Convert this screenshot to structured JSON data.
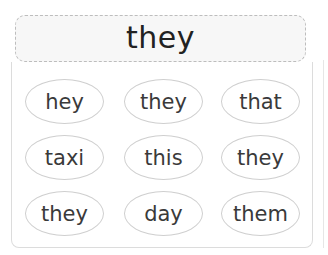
{
  "target": {
    "word": "they"
  },
  "options": [
    {
      "label": "hey"
    },
    {
      "label": "they"
    },
    {
      "label": "that"
    },
    {
      "label": "taxi"
    },
    {
      "label": "this"
    },
    {
      "label": "they"
    },
    {
      "label": "they"
    },
    {
      "label": "day"
    },
    {
      "label": "them"
    }
  ]
}
